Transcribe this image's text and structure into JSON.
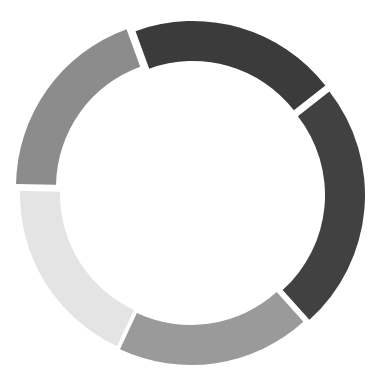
{
  "diagram": {
    "type": "segmented-ring",
    "canvas": {
      "width": 382,
      "height": 388,
      "background": "#ffffff"
    },
    "center": [
      191,
      191
    ],
    "inner_radius": 128,
    "outer_radius": 168,
    "segments": [
      {
        "name": "segment-top-dark",
        "start_deg": -20,
        "end_deg": 52,
        "offset": [
          2,
          -2
        ],
        "color": "#3b3b3b"
      },
      {
        "name": "segment-right-dark",
        "start_deg": 52,
        "end_deg": 138,
        "offset": [
          6,
          4
        ],
        "color": "#414141"
      },
      {
        "name": "segment-bottom-gray",
        "start_deg": 138,
        "end_deg": 205,
        "offset": [
          0,
          6
        ],
        "color": "#9a9a9a"
      },
      {
        "name": "segment-left-light",
        "start_deg": 205,
        "end_deg": 271,
        "offset": [
          -3,
          3
        ],
        "color": "#e4e4e4"
      },
      {
        "name": "segment-topleft-gray",
        "start_deg": 271,
        "end_deg": 340,
        "offset": [
          -7,
          -4
        ],
        "color": "#8c8c8c"
      }
    ]
  }
}
